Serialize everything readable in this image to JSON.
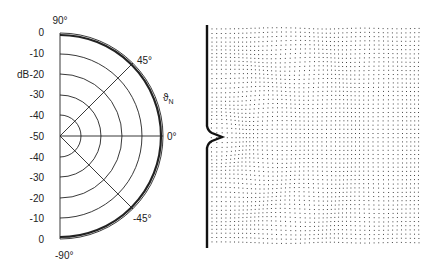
{
  "polar_plot": {
    "unit_label": "dB",
    "angle_label": "ϑ",
    "angle_label_sub": "N",
    "radial_ticks": [
      "0",
      "-10",
      "-20",
      "-30",
      "-40",
      "-50"
    ],
    "radial_ticks_lower": [
      "-40",
      "-30",
      "-20",
      "-10",
      "0"
    ],
    "angle_ticks": {
      "top": "90°",
      "upper": "45°",
      "mid": "0°",
      "lower": "-45°",
      "bottom": "-90°"
    }
  },
  "wave_field": {
    "description": "Particle displacement field near wall with notch"
  }
}
